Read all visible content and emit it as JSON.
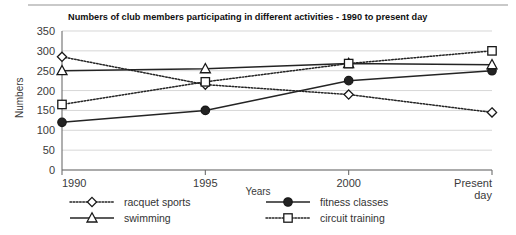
{
  "chart_data": {
    "type": "line",
    "title": "Numbers of club members participating in different activities - 1990 to present day",
    "xlabel": "Years",
    "ylabel": "Numbers",
    "categories": [
      "1990",
      "1995",
      "2000",
      "Present day"
    ],
    "x_tick_labels": [
      "1990",
      "1995",
      "2000",
      "Present\nday"
    ],
    "ylim": [
      0,
      350
    ],
    "y_ticks": [
      0,
      50,
      100,
      150,
      200,
      250,
      300,
      350
    ],
    "y_tick_labels": [
      "0",
      "50",
      "100",
      "150",
      "200",
      "250",
      "300",
      "350"
    ],
    "grid": true,
    "legend_position": "bottom",
    "series": [
      {
        "name": "racquet sports",
        "values": [
          285,
          215,
          190,
          145
        ],
        "line_style": "dotted",
        "marker": "diamond-open",
        "color": "#242424"
      },
      {
        "name": "fitness classes",
        "values": [
          120,
          150,
          225,
          250
        ],
        "line_style": "solid",
        "marker": "circle-filled",
        "color": "#242424"
      },
      {
        "name": "swimming",
        "values": [
          250,
          255,
          268,
          265
        ],
        "line_style": "solid",
        "marker": "triangle-open",
        "color": "#242424"
      },
      {
        "name": "circuit training",
        "values": [
          165,
          222,
          268,
          300
        ],
        "line_style": "dotted",
        "marker": "square-open",
        "color": "#242424"
      }
    ]
  },
  "legend": {
    "entries": [
      {
        "label": "racquet sports",
        "icon": "diamond-open-marker-icon"
      },
      {
        "label": "fitness classes",
        "icon": "circle-filled-marker-icon"
      },
      {
        "label": "swimming",
        "icon": "triangle-open-marker-icon"
      },
      {
        "label": "circuit training",
        "icon": "square-open-marker-icon"
      }
    ]
  }
}
